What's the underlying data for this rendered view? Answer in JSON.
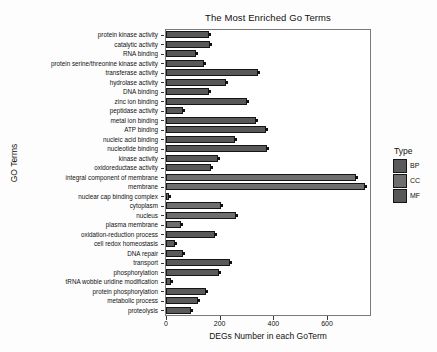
{
  "chart_data": {
    "type": "bar",
    "orientation": "horizontal",
    "title": "The Most Enriched Go Terms",
    "xlabel": "DEGs Number in each GoTerm",
    "ylabel": "GO Terms",
    "xlim": [
      0,
      760
    ],
    "xticks": [
      0,
      200,
      400,
      600
    ],
    "xticklabels": [
      "0",
      "200",
      "400",
      "600"
    ],
    "grid": false,
    "legend": {
      "title": "Type",
      "position": "right",
      "entries": [
        {
          "label": "BP",
          "color": "#5a5a5a"
        },
        {
          "label": "CC",
          "color": "#6e6e6e"
        },
        {
          "label": "MF",
          "color": "#585858"
        }
      ]
    },
    "categories": [
      "protein kinase activity",
      "catalytic activity",
      "RNA binding",
      "protein serine/threonine kinase activity",
      "transferase activity",
      "hydrolase activity",
      "DNA binding",
      "zinc ion binding",
      "peptidase activity",
      "metal ion binding",
      "ATP binding",
      "nucleic acid binding",
      "nucleotide binding",
      "kinase activity",
      "oxidoreductase activity",
      "integral component of membrane",
      "membrane",
      "nuclear cap binding complex",
      "cytoplasm",
      "nucleus",
      "plasma membrane",
      "oxidation-reduction process",
      "cell redox homeostasis",
      "DNA repair",
      "transport",
      "phosphorylation",
      "tRNA wobble uridine modification",
      "protein phosphorylation",
      "metabolic process",
      "proteolysis"
    ],
    "values": [
      160,
      164,
      110,
      140,
      341,
      224,
      162,
      303,
      63,
      334,
      372,
      257,
      377,
      194,
      166,
      709,
      743,
      12,
      206,
      261,
      57,
      183,
      32,
      63,
      240,
      196,
      17,
      148,
      120,
      94
    ],
    "types": [
      "MF",
      "MF",
      "MF",
      "MF",
      "MF",
      "MF",
      "MF",
      "MF",
      "MF",
      "MF",
      "MF",
      "MF",
      "MF",
      "MF",
      "MF",
      "CC",
      "CC",
      "CC",
      "CC",
      "CC",
      "CC",
      "BP",
      "BP",
      "BP",
      "BP",
      "BP",
      "BP",
      "BP",
      "BP",
      "BP"
    ]
  }
}
